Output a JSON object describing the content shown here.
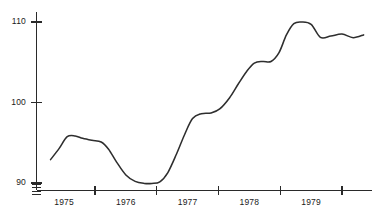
{
  "chart_data": {
    "type": "line",
    "title": "",
    "subtitle": "",
    "xlabel": "",
    "ylabel": "",
    "grid": false,
    "legend": false,
    "legend_position": "none",
    "xlim": [
      1974.6,
      1980.0
    ],
    "ylim": [
      89.0,
      111.0
    ],
    "y_ticks": [
      90,
      100,
      110
    ],
    "y_tick_labels": [
      "90",
      "100",
      "110"
    ],
    "y_minor_ticks": [
      88.6,
      89.0,
      89.4,
      89.8
    ],
    "x_ticks": [
      1975.5,
      1976.5,
      1977.5,
      1978.5,
      1979.5
    ],
    "x_tick_labels": [
      "1975",
      "1976",
      "1977",
      "1978",
      "1979"
    ],
    "x_label_positions": [
      1975.0,
      1976.0,
      1977.0,
      1978.0,
      1979.0
    ],
    "series": [
      {
        "name": "index",
        "color": "#2e2e2e",
        "x": [
          1974.78,
          1974.92,
          1975.05,
          1975.18,
          1975.3,
          1975.45,
          1975.6,
          1975.72,
          1975.85,
          1976.0,
          1976.15,
          1976.3,
          1976.42,
          1976.55,
          1976.68,
          1976.82,
          1976.95,
          1977.08,
          1977.22,
          1977.38,
          1977.52,
          1977.68,
          1977.82,
          1977.95,
          1978.08,
          1978.22,
          1978.35,
          1978.48,
          1978.6,
          1978.72,
          1978.85,
          1979.0,
          1979.15,
          1979.32,
          1979.5,
          1979.68,
          1979.85
        ],
        "y": [
          92.9,
          94.3,
          95.75,
          95.85,
          95.55,
          95.3,
          95.1,
          94.2,
          92.6,
          91.0,
          90.2,
          89.95,
          89.95,
          90.15,
          91.3,
          93.6,
          96.0,
          98.0,
          98.6,
          98.7,
          99.2,
          100.6,
          102.3,
          103.8,
          104.9,
          105.1,
          105.1,
          106.2,
          108.4,
          109.8,
          110.0,
          109.7,
          108.1,
          108.25,
          108.5,
          108.05,
          108.4
        ]
      }
    ]
  },
  "axis": {
    "y_axis_name": "vertical-value-axis",
    "x_axis_name": "horizontal-time-axis"
  }
}
